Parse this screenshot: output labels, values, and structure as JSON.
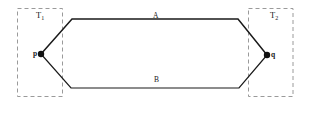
{
  "figure": {
    "type": "geometric-diagram",
    "background_color": "#ffffff",
    "stroke_color": "#1a1a1a",
    "dashed_color": "#9a9a9a"
  },
  "regions": [
    {
      "id": "T1",
      "label_base": "T",
      "label_sub": "1",
      "style": "dashed-rectangle",
      "x": 17,
      "y": 8,
      "width": 45,
      "height": 89
    },
    {
      "id": "T2",
      "label_base": "T",
      "label_sub": "2",
      "style": "dashed-rectangle",
      "x": 248,
      "y": 8,
      "width": 45,
      "height": 89
    }
  ],
  "points": [
    {
      "id": "p",
      "label": "p",
      "x": 41,
      "y": 54
    },
    {
      "id": "q",
      "label": "q",
      "x": 267,
      "y": 55
    }
  ],
  "paths": [
    {
      "id": "A",
      "label": "A",
      "description": "upper path from p to q",
      "vertices": "41,54 72,19 238,19 267,55"
    },
    {
      "id": "B",
      "label": "B",
      "description": "lower path from p to q",
      "vertices": "41,54 71,88 239,88 267,55"
    }
  ]
}
